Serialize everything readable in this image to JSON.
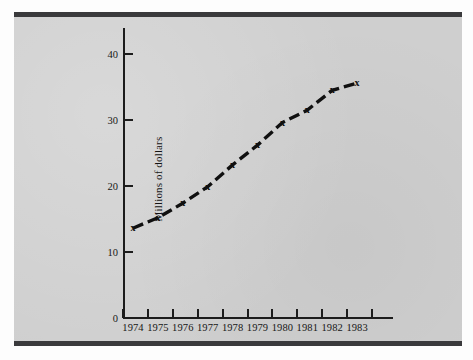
{
  "figure": {
    "background_color": "#cfcfcf",
    "rule_color": "#3a3a3c",
    "axis_color": "#1c1c1c",
    "line_color": "#101010",
    "marker_symbol": "x"
  },
  "chart_data": {
    "type": "line",
    "title": "",
    "xlabel": "",
    "ylabel": "Millions of dollars",
    "categories": [
      "1974",
      "1975",
      "1976",
      "1977",
      "1978",
      "1979",
      "1980",
      "1981",
      "1982",
      "1983"
    ],
    "x": [
      1974,
      1975,
      1976,
      1977,
      1978,
      1979,
      1980,
      1981,
      1982,
      1983
    ],
    "values": [
      13.6,
      15.2,
      17.4,
      19.9,
      23.2,
      26.2,
      29.6,
      31.5,
      34.5,
      35.6
    ],
    "series": [
      {
        "name": "Millions of dollars",
        "values": [
          13.6,
          15.2,
          17.4,
          19.9,
          23.2,
          26.2,
          29.6,
          31.5,
          34.5,
          35.6
        ]
      }
    ],
    "ylim": [
      0,
      44
    ],
    "xlim": [
      1973.5,
      1983.9
    ],
    "yticks": [
      0,
      10,
      20,
      30,
      40
    ],
    "ytick_labels": [
      "0",
      "10",
      "20",
      "30",
      "40"
    ],
    "xtick_labels": [
      "1974",
      "1975",
      "1976",
      "1977",
      "1978",
      "1979",
      "1980",
      "1981",
      "1982",
      "1983"
    ],
    "grid": false,
    "legend": "none",
    "marker": "x",
    "line_style": "dashed-thick"
  }
}
